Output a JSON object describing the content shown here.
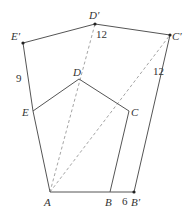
{
  "diagram": {
    "points": {
      "A": {
        "label": "A"
      },
      "B": {
        "label": "B"
      },
      "C": {
        "label": "C"
      },
      "D": {
        "label": "D"
      },
      "E": {
        "label": "E"
      },
      "Bp": {
        "label": "B′"
      },
      "Cp": {
        "label": "C′"
      },
      "Dp": {
        "label": "D′"
      },
      "Ep": {
        "label": "E′"
      }
    },
    "measurements": {
      "BBp": "6",
      "CpAngle": "12",
      "DpAngle": "12",
      "EpAngle": "9"
    }
  }
}
